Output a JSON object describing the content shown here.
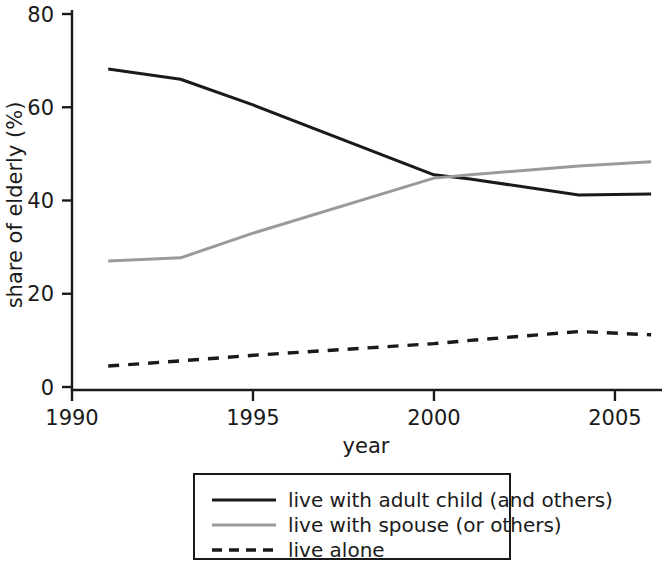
{
  "chart_data": {
    "type": "line",
    "title": "",
    "xlabel": "year",
    "ylabel": "share of elderly (%)",
    "xlim": [
      1990,
      2006.3
    ],
    "ylim": [
      0,
      80
    ],
    "xticks": [
      1990,
      1995,
      2000,
      2005
    ],
    "xtick_labels": [
      "1990",
      "1995",
      "2000",
      "2005"
    ],
    "yticks": [
      0,
      20,
      40,
      60,
      80
    ],
    "ytick_labels": [
      "0",
      "20",
      "40",
      "60",
      "80"
    ],
    "grid": false,
    "legend_position": "below-center",
    "x": [
      1991,
      1993,
      1995,
      2000,
      2001,
      2004,
      2006
    ],
    "series": [
      {
        "name": "live with adult child (and others)",
        "style": "solid",
        "color": "#1a1a1a",
        "values": [
          68.2,
          66.0,
          60.5,
          45.5,
          44.6,
          41.2,
          41.4
        ]
      },
      {
        "name": "live with spouse (or others)",
        "style": "solid",
        "color": "#9a9a9a",
        "values": [
          27.0,
          27.7,
          33.0,
          44.8,
          45.5,
          47.4,
          48.3
        ]
      },
      {
        "name": "live alone",
        "style": "dashed",
        "color": "#1a1a1a",
        "values": [
          4.5,
          5.6,
          6.8,
          9.3,
          10.0,
          11.9,
          11.2
        ]
      }
    ]
  },
  "legend": {
    "entries": [
      {
        "label": "live with adult child (and others)",
        "style": "solid",
        "color": "#1a1a1a"
      },
      {
        "label": "live with spouse (or others)",
        "style": "solid",
        "color": "#9a9a9a"
      },
      {
        "label": "live alone",
        "style": "dashed",
        "color": "#1a1a1a"
      }
    ]
  },
  "colors": {
    "axis": "#1a1a1a",
    "text": "#1a1a1a",
    "background": "#ffffff",
    "series_black": "#1a1a1a",
    "series_gray": "#9a9a9a"
  }
}
